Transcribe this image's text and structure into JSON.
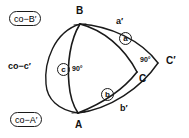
{
  "figure": {
    "background_color": "#ffffff",
    "stroke_color": "#1a1a1a",
    "text_color": "#111111",
    "width": 189,
    "height": 138
  },
  "vertices": {
    "a": "A",
    "b": "B",
    "c": "C",
    "c_prime": "C′"
  },
  "sides": {
    "a_prime": "a′",
    "b_prime": "b′"
  },
  "circled": {
    "a": "a",
    "b": "b",
    "c": "c"
  },
  "angles": {
    "right_angle_inner": "90°",
    "right_angle_outer": "90°"
  },
  "boxed_labels": {
    "co_b_prime": "co−B′",
    "co_a_prime": "co−A′"
  },
  "plain_labels": {
    "co_c_prime": "co−c′"
  }
}
